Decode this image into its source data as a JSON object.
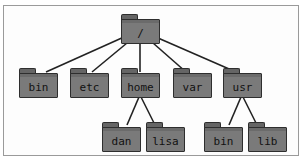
{
  "diagram": {
    "type": "directory-tree",
    "colors": {
      "folder_fill": "#7a7a7a",
      "folder_tab": "#656565",
      "folder_outline": "#2e2e2e",
      "edge": "#222222",
      "frame_border": "#9a9a9a",
      "background": "#ffffff"
    },
    "nodes": [
      {
        "id": "root",
        "label": "/",
        "x": 121,
        "y": 14
      },
      {
        "id": "bin",
        "label": "bin",
        "x": 19,
        "y": 68
      },
      {
        "id": "etc",
        "label": "etc",
        "x": 70,
        "y": 68
      },
      {
        "id": "home",
        "label": "home",
        "x": 121,
        "y": 68
      },
      {
        "id": "var",
        "label": "var",
        "x": 173,
        "y": 68
      },
      {
        "id": "usr",
        "label": "usr",
        "x": 223,
        "y": 68
      },
      {
        "id": "dan",
        "label": "dan",
        "x": 102,
        "y": 122
      },
      {
        "id": "lisa",
        "label": "lisa",
        "x": 146,
        "y": 122
      },
      {
        "id": "usr_bin",
        "label": "bin",
        "x": 204,
        "y": 122
      },
      {
        "id": "usr_lib",
        "label": "lib",
        "x": 248,
        "y": 122
      }
    ],
    "edges": [
      {
        "from": "root",
        "to": "bin",
        "x1": 124,
        "y1": 37,
        "x2": 46,
        "y2": 72
      },
      {
        "from": "root",
        "to": "etc",
        "x1": 127,
        "y1": 43,
        "x2": 92,
        "y2": 72
      },
      {
        "from": "root",
        "to": "home",
        "x1": 140,
        "y1": 43,
        "x2": 140,
        "y2": 72
      },
      {
        "from": "root",
        "to": "var",
        "x1": 153,
        "y1": 43,
        "x2": 186,
        "y2": 72
      },
      {
        "from": "root",
        "to": "usr",
        "x1": 158,
        "y1": 38,
        "x2": 236,
        "y2": 72
      },
      {
        "from": "home",
        "to": "dan",
        "x1": 139,
        "y1": 97,
        "x2": 127,
        "y2": 125
      },
      {
        "from": "home",
        "to": "lisa",
        "x1": 141,
        "y1": 97,
        "x2": 155,
        "y2": 125
      },
      {
        "from": "usr",
        "to": "usr_bin",
        "x1": 241,
        "y1": 97,
        "x2": 229,
        "y2": 125
      },
      {
        "from": "usr",
        "to": "usr_lib",
        "x1": 243,
        "y1": 97,
        "x2": 257,
        "y2": 125
      }
    ]
  }
}
